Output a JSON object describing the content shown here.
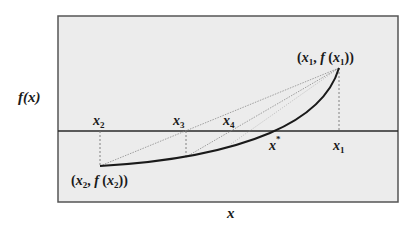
{
  "diagram": {
    "y_axis_label": "f(x)",
    "x_axis_label": "x",
    "colors": {
      "background": "#ececec",
      "frame": "#555555",
      "curve": "#1a1a1a",
      "axis": "#2a2a2a",
      "secant": "#8a8a8a",
      "dashed": "#777777"
    },
    "points": {
      "p1": {
        "label_var": "x",
        "label_sub": "1",
        "full": "(x1, f(x1))"
      },
      "p2": {
        "label_var": "x",
        "label_sub": "2",
        "full": "(x2, f(x2))"
      }
    },
    "axis_ticks": [
      {
        "id": "x2",
        "var": "x",
        "sub": "2"
      },
      {
        "id": "x3",
        "var": "x",
        "sub": "3"
      },
      {
        "id": "x4",
        "var": "x",
        "sub": "4"
      },
      {
        "id": "xstar",
        "var": "x",
        "sup": "*"
      },
      {
        "id": "x1",
        "var": "x",
        "sub": "1"
      }
    ]
  }
}
